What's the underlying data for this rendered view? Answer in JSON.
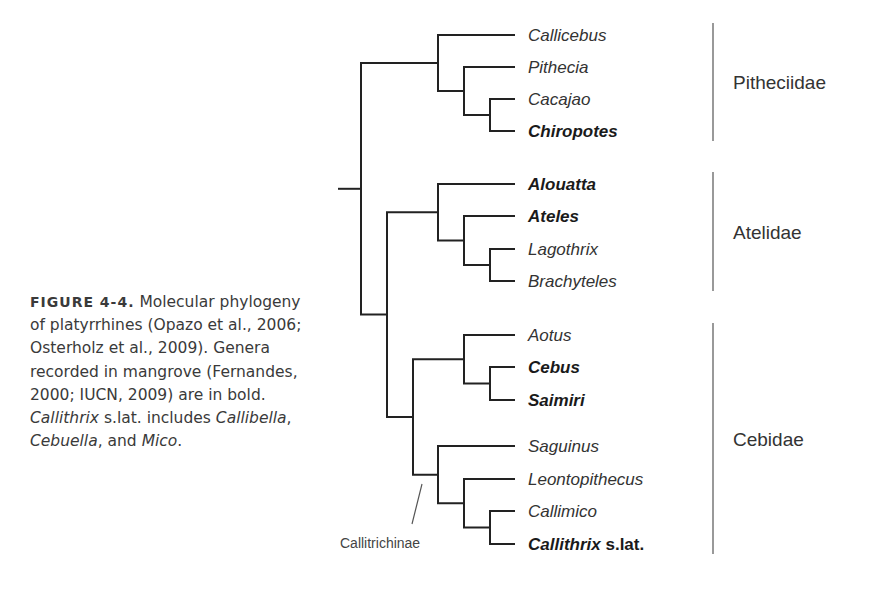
{
  "caption": {
    "label": "FIGURE 4-4.",
    "parts": [
      {
        "t": " Molecular phylogeny of platyrrhines (Opazo et al., 2006; Osterholz et al., 2009). Genera recorded in mangrove (Fernandes, 2000; IUCN, 2009) are in bold. ",
        "i": false
      },
      {
        "t": "Callithrix",
        "i": true
      },
      {
        "t": " s.lat. includes ",
        "i": false
      },
      {
        "t": "Callibella",
        "i": true
      },
      {
        "t": ", ",
        "i": false
      },
      {
        "t": "Cebuella",
        "i": true
      },
      {
        "t": ", and ",
        "i": false
      },
      {
        "t": "Mico",
        "i": true
      },
      {
        "t": ".",
        "i": false
      }
    ]
  },
  "tree": {
    "leaves": [
      {
        "name": "Callicebus",
        "bold": false
      },
      {
        "name": "Pithecia",
        "bold": false
      },
      {
        "name": "Cacajao",
        "bold": false
      },
      {
        "name": "Chiropotes",
        "bold": true
      },
      {
        "name": "Alouatta",
        "bold": true
      },
      {
        "name": "Ateles",
        "bold": true
      },
      {
        "name": "Lagothrix",
        "bold": false
      },
      {
        "name": "Brachyteles",
        "bold": false
      },
      {
        "name": "Aotus",
        "bold": false
      },
      {
        "name": "Cebus",
        "bold": true
      },
      {
        "name": "Saimiri",
        "bold": true
      },
      {
        "name": "Saguinus",
        "bold": false
      },
      {
        "name": "Leontopithecus",
        "bold": false
      },
      {
        "name": "Callimico",
        "bold": false
      },
      {
        "name": "Callithrix",
        "suffix": " s.lat.",
        "bold": true
      }
    ],
    "families": [
      {
        "name": "Pitheciidae",
        "from": 0,
        "to": 3
      },
      {
        "name": "Atelidae",
        "from": 4,
        "to": 7
      },
      {
        "name": "Cebidae",
        "from": 8,
        "to": 14
      }
    ],
    "subfamily_label": "Callitrichinae"
  }
}
